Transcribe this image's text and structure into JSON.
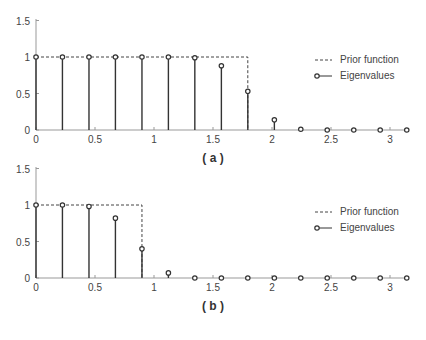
{
  "chart_data": [
    {
      "type": "stem",
      "caption": "( a )",
      "title": "",
      "xlabel": "",
      "ylabel": "",
      "xlim": [
        0,
        3.14
      ],
      "ylim": [
        0,
        1.5
      ],
      "xticks": [
        "0",
        "0.5",
        "1",
        "1.5",
        "2",
        "2.5",
        "3"
      ],
      "yticks": [
        "0",
        "0.5",
        "1",
        "1.5"
      ],
      "grid": false,
      "legend": {
        "position": "right",
        "entries": [
          "Prior function",
          "Eigenvalues"
        ]
      },
      "series": [
        {
          "name": "Prior function",
          "style": "dashed",
          "x": [
            0,
            1.795,
            1.795
          ],
          "y": [
            1,
            1,
            0
          ]
        },
        {
          "name": "Eigenvalues",
          "style": "stem",
          "x": [
            0,
            0.224,
            0.449,
            0.673,
            0.898,
            1.122,
            1.346,
            1.571,
            1.795,
            2.02,
            2.244,
            2.468,
            2.693,
            2.917,
            3.142
          ],
          "y": [
            1.0,
            1.0,
            1.0,
            1.0,
            1.0,
            1.0,
            0.99,
            0.88,
            0.53,
            0.14,
            0.01,
            0.0,
            0.0,
            0.0,
            0.0
          ]
        }
      ]
    },
    {
      "type": "stem",
      "caption": "( b )",
      "title": "",
      "xlabel": "",
      "ylabel": "",
      "xlim": [
        0,
        3.14
      ],
      "ylim": [
        0,
        1.5
      ],
      "xticks": [
        "0",
        "0.5",
        "1",
        "1.5",
        "2",
        "2.5",
        "3"
      ],
      "yticks": [
        "0",
        "0.5",
        "1",
        "1.5"
      ],
      "grid": false,
      "legend": {
        "position": "right",
        "entries": [
          "Prior function",
          "Eigenvalues"
        ]
      },
      "series": [
        {
          "name": "Prior function",
          "style": "dashed",
          "x": [
            0,
            0.898,
            0.898
          ],
          "y": [
            1,
            1,
            0
          ]
        },
        {
          "name": "Eigenvalues",
          "style": "stem",
          "x": [
            0,
            0.224,
            0.449,
            0.673,
            0.898,
            1.122,
            1.346,
            1.571,
            1.795,
            2.02,
            2.244,
            2.468,
            2.693,
            2.917,
            3.142
          ],
          "y": [
            1.0,
            1.0,
            0.98,
            0.82,
            0.4,
            0.07,
            0.0,
            0.0,
            0.0,
            0.0,
            0.0,
            0.0,
            0.0,
            0.0,
            0.0
          ]
        }
      ]
    }
  ],
  "colors": {
    "axis": "#999999",
    "stem": "#333333",
    "dashed": "#444444",
    "marker": "#333333",
    "text": "#444444"
  }
}
